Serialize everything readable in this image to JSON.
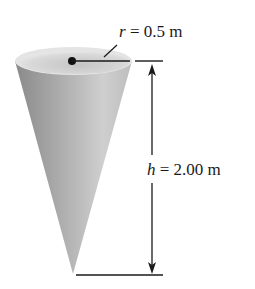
{
  "figure": {
    "type": "cone-dimension-diagram",
    "shape": "inverted right circular cone",
    "colors": {
      "background": "#ffffff",
      "cone_dark": "#7e7e7e",
      "cone_light": "#d4d4d4",
      "rim_top": "#e6e6e6",
      "rim_inner": "#b9b9b9",
      "line": "#1a1a1a"
    }
  },
  "labels": {
    "radius": {
      "symbol": "r",
      "equals": " = ",
      "value": "0.5 m"
    },
    "height": {
      "symbol": "h",
      "equals": " = ",
      "value": "2.00 m"
    }
  }
}
